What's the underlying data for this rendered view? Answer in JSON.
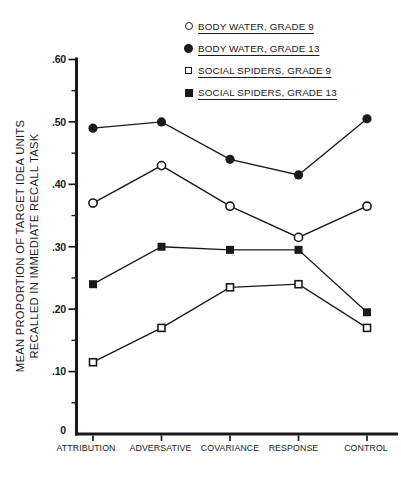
{
  "figure": {
    "background": "#ffffff",
    "ink_color": "#1a1a1a"
  },
  "chart_data": {
    "type": "line",
    "title": "",
    "xlabel": "",
    "ylabel_lines": [
      "MEAN PROPORTION OF TARGET IDEA UNITS",
      "RECALLED IN IMMEDIATE RECALL TASK"
    ],
    "categories": [
      "ATTRIBUTION",
      "ADVERSATIVE",
      "COVARIANCE",
      "RESPONSE",
      "CONTROL"
    ],
    "series": [
      {
        "name": "BODY WATER, GRADE 9",
        "marker": "open-circle",
        "values": [
          0.37,
          0.43,
          0.365,
          0.315,
          0.365
        ]
      },
      {
        "name": "BODY WATER, GRADE 13",
        "marker": "filled-circle",
        "values": [
          0.49,
          0.5,
          0.44,
          0.415,
          0.505
        ]
      },
      {
        "name": "SOCIAL SPIDERS, GRADE 9",
        "marker": "open-square",
        "values": [
          0.115,
          0.17,
          0.235,
          0.24,
          0.17
        ]
      },
      {
        "name": "SOCIAL SPIDERS, GRADE 13",
        "marker": "filled-square",
        "values": [
          0.24,
          0.3,
          0.295,
          0.295,
          0.195
        ]
      }
    ],
    "ylim": [
      0,
      0.6
    ],
    "ytick_step": 0.1,
    "yminor_step": 0.05,
    "yticks": [
      {
        "v": 0.0,
        "label": "0"
      },
      {
        "v": 0.1,
        "label": ".10"
      },
      {
        "v": 0.2,
        "label": ".20"
      },
      {
        "v": 0.3,
        "label": ".30"
      },
      {
        "v": 0.4,
        "label": ".40"
      },
      {
        "v": 0.5,
        "label": ".50"
      },
      {
        "v": 0.6,
        "label": ".60"
      }
    ],
    "grid": false,
    "legend_position": "top-right",
    "legend_underlined": true
  }
}
